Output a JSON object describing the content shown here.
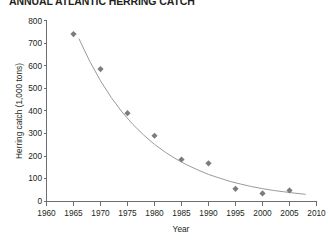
{
  "chart_data": {
    "type": "scatter",
    "title": "ANNUAL ATLANTIC HERRING CATCH",
    "xlabel": "Year",
    "ylabel": "Herring catch (1,000 tons)",
    "xlim": [
      1960,
      2010
    ],
    "ylim": [
      0,
      800
    ],
    "xticks": [
      1960,
      1965,
      1970,
      1975,
      1980,
      1985,
      1990,
      1995,
      2000,
      2005,
      2010
    ],
    "yticks": [
      0,
      100,
      200,
      300,
      400,
      500,
      600,
      700,
      800
    ],
    "grid": false,
    "legend": false,
    "marker_shape": "diamond",
    "marker_color": "#7c7c7c",
    "curve_color": "#9a9a9a",
    "x": [
      1965,
      1970,
      1975,
      1980,
      1985,
      1990,
      1995,
      2000,
      2005
    ],
    "values": [
      740,
      585,
      390,
      290,
      185,
      168,
      55,
      35,
      48
    ],
    "series": [
      {
        "name": "Herring catch",
        "x": [
          1965,
          1970,
          1975,
          1980,
          1985,
          1990,
          1995,
          2000,
          2005
        ],
        "values": [
          740,
          585,
          390,
          290,
          185,
          168,
          55,
          35,
          48
        ]
      }
    ],
    "fit_curve": {
      "name": "exponential decay fit",
      "x": [
        1966,
        1968,
        1970,
        1972,
        1974,
        1976,
        1978,
        1980,
        1982,
        1984,
        1986,
        1988,
        1990,
        1992,
        1994,
        1996,
        1998,
        2000,
        2002,
        2004,
        2006,
        2008
      ],
      "values": [
        720,
        620,
        533,
        459,
        395,
        340,
        293,
        252,
        217,
        187,
        161,
        139,
        119,
        103,
        88,
        76,
        65,
        56,
        48,
        42,
        36,
        31
      ]
    }
  },
  "axes": {
    "y_tick_labels": [
      "800",
      "700",
      "600",
      "500",
      "400",
      "300",
      "200",
      "100",
      "0"
    ],
    "x_tick_labels": [
      "1960",
      "1965",
      "1970",
      "1975",
      "1980",
      "1985",
      "1990",
      "1995",
      "2000",
      "2005",
      "2010"
    ]
  }
}
